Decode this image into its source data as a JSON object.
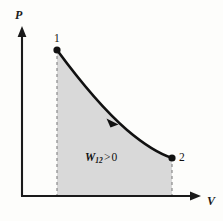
{
  "figure": {
    "name": "pv-diagram-work-positive",
    "width": 223,
    "height": 221,
    "background_color": "#fdfdfb"
  },
  "axes": {
    "y_axis": {
      "label": "P",
      "icon": "arrow-up-icon",
      "color": "#1a1a1a",
      "x_px": 22,
      "from_y_px": 196,
      "to_y_px": 27
    },
    "x_axis": {
      "label": "V",
      "icon": "arrow-right-icon",
      "color": "#1a1a1a",
      "y_px": 196,
      "from_x_px": 21,
      "to_x_px": 200
    }
  },
  "points": [
    {
      "label": "1",
      "x_px": 57,
      "y_px": 50,
      "label_x_px": 54,
      "label_y_px": 33
    },
    {
      "label": "2",
      "x_px": 172,
      "y_px": 158,
      "label_x_px": 179,
      "label_y_px": 152
    }
  ],
  "process_curve": {
    "color": "#111111",
    "stroke_width": 2.6,
    "direction_marker": "arrow-along-curve-icon",
    "path": "M 57 50 C 82 84, 104 110, 127 130 C 147 147, 160 154, 172 158"
  },
  "dashed_lines": {
    "color": "#8a8a8a",
    "dash": "3 3",
    "left": {
      "x_px": 57,
      "from_y_px": 50,
      "to_y_px": 196
    },
    "right": {
      "x_px": 172,
      "from_y_px": 158,
      "to_y_px": 196
    }
  },
  "shaded_region": {
    "fill_color": "#d9d9d9",
    "path": "M 57 50 C 82 84, 104 110, 127 130 C 147 147, 160 154, 172 158 L 172 195 L 57 195 Z"
  },
  "work_label": {
    "symbol": "W",
    "subscript": "12",
    "relation": ">",
    "value": "0",
    "x_px": 85,
    "y_px": 152
  },
  "chart_data": {
    "type": "line",
    "title": "",
    "xlabel": "V",
    "ylabel": "P",
    "series": [
      {
        "name": "Process 1 → 2",
        "points": [
          {
            "state": "1",
            "V": 0.2,
            "P": 0.93
          },
          {
            "state": "2",
            "V": 0.84,
            "P": 0.22
          }
        ]
      }
    ],
    "annotations": [
      {
        "text": "W12 > 0",
        "meaning": "Work done by the gas is positive (expansion)"
      },
      {
        "text": "1",
        "meaning": "initial state"
      },
      {
        "text": "2",
        "meaning": "final state"
      }
    ],
    "shaded_area_meaning": "Area under the P-V curve between states 1 and 2 equals the work W12",
    "grid": false,
    "legend": false
  }
}
